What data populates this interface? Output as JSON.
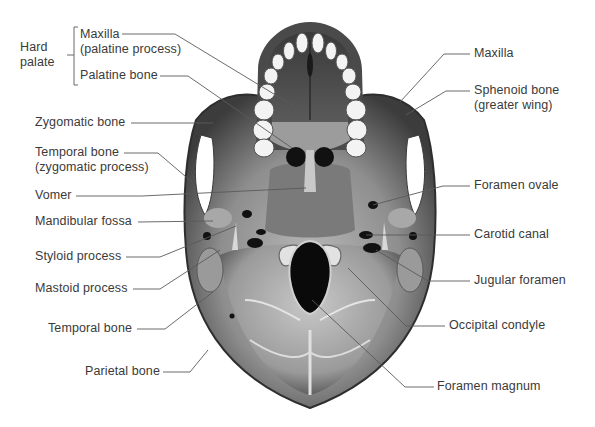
{
  "figure": {
    "colors": {
      "background": "#ffffff",
      "label_text": "#3a3a3a",
      "leader_line": "#5a5a5a",
      "bone_dark": "#3e3e3e",
      "bone_mid": "#8a8a8a",
      "bone_light": "#c9c9c9",
      "teeth": "#f2f2f2",
      "foramen": "#0d0d0d"
    }
  },
  "group_label": {
    "line1": "Hard",
    "line2": "palate"
  },
  "labels_left": [
    {
      "id": "maxilla-palatine",
      "line1": "Maxilla",
      "line2": "(palatine process)"
    },
    {
      "id": "palatine-bone",
      "line1": "Palatine bone"
    },
    {
      "id": "zygomatic-bone",
      "line1": "Zygomatic bone"
    },
    {
      "id": "temporal-zygomatic",
      "line1": "Temporal bone",
      "line2": "(zygomatic process)"
    },
    {
      "id": "vomer",
      "line1": "Vomer"
    },
    {
      "id": "mandibular-fossa",
      "line1": "Mandibular fossa"
    },
    {
      "id": "styloid-process",
      "line1": "Styloid process"
    },
    {
      "id": "mastoid-process",
      "line1": "Mastoid process"
    },
    {
      "id": "temporal-bone",
      "line1": "Temporal bone"
    },
    {
      "id": "parietal-bone",
      "line1": "Parietal bone"
    }
  ],
  "labels_right": [
    {
      "id": "maxilla",
      "line1": "Maxilla"
    },
    {
      "id": "sphenoid-greater-wing",
      "line1": "Sphenoid bone",
      "line2": "(greater wing)"
    },
    {
      "id": "foramen-ovale",
      "line1": "Foramen ovale"
    },
    {
      "id": "carotid-canal",
      "line1": "Carotid canal"
    },
    {
      "id": "jugular-foramen",
      "line1": "Jugular foramen"
    },
    {
      "id": "occipital-condyle",
      "line1": "Occipital condyle"
    },
    {
      "id": "foramen-magnum",
      "line1": "Foramen magnum"
    }
  ]
}
